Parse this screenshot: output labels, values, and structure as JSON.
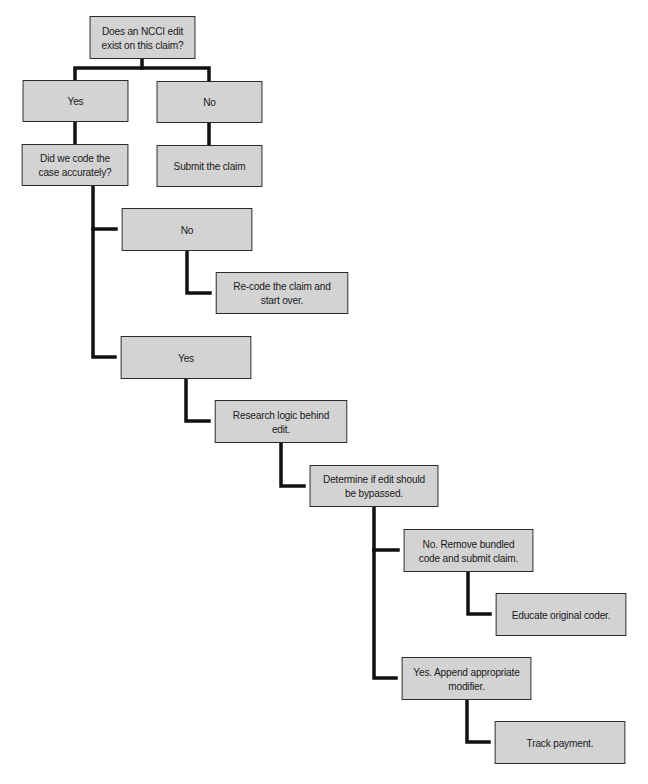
{
  "diagram": {
    "type": "decision-flowchart",
    "colors": {
      "box_fill": "#d3d3d3",
      "box_border": "#2a2a2a",
      "connector": "#111111",
      "background": "#ffffff"
    },
    "nodes": [
      {
        "id": "q1",
        "label": "Does an NCCI edit exist on this claim?"
      },
      {
        "id": "q1_yes",
        "label": "Yes"
      },
      {
        "id": "q1_no",
        "label": "No"
      },
      {
        "id": "q2",
        "label": "Did we code the case accurately?"
      },
      {
        "id": "submit",
        "label": "Submit the claim"
      },
      {
        "id": "q2_no",
        "label": "No"
      },
      {
        "id": "recode",
        "label": "Re-code the claim and start over."
      },
      {
        "id": "q2_yes",
        "label": "Yes"
      },
      {
        "id": "research",
        "label": "Research logic behind edit."
      },
      {
        "id": "determine",
        "label": "Determine if edit should be bypassed."
      },
      {
        "id": "remove",
        "label": "No. Remove bundled code and submit claim."
      },
      {
        "id": "educate",
        "label": "Educate original coder."
      },
      {
        "id": "append",
        "label": "Yes.  Append appropriate modifier."
      },
      {
        "id": "track",
        "label": "Track payment."
      }
    ],
    "edges": [
      [
        "q1",
        "q1_yes"
      ],
      [
        "q1",
        "q1_no"
      ],
      [
        "q1_yes",
        "q2"
      ],
      [
        "q1_no",
        "submit"
      ],
      [
        "q2",
        "q2_no"
      ],
      [
        "q2",
        "q2_yes"
      ],
      [
        "q2_no",
        "recode"
      ],
      [
        "q2_yes",
        "research"
      ],
      [
        "research",
        "determine"
      ],
      [
        "determine",
        "remove"
      ],
      [
        "determine",
        "append"
      ],
      [
        "remove",
        "educate"
      ],
      [
        "append",
        "track"
      ]
    ]
  }
}
